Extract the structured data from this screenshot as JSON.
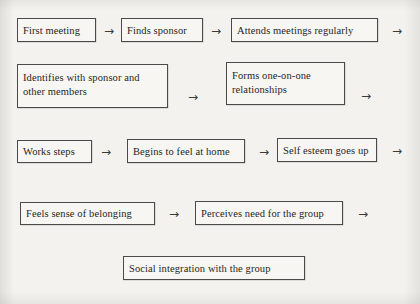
{
  "diagram": {
    "arrow_glyph": "→",
    "rows": [
      {
        "id": "row-1",
        "nodes": [
          {
            "id": "first-meeting",
            "label": "First meeting"
          },
          {
            "id": "finds-sponsor",
            "label": "Finds sponsor"
          },
          {
            "id": "attends-meetings-regularly",
            "label": "Attends meetings regularly"
          }
        ],
        "trailing_arrow": true
      },
      {
        "id": "row-2",
        "nodes": [
          {
            "id": "identifies-with-sponsor",
            "label": "Identifies with sponsor and other members"
          },
          {
            "id": "forms-one-on-one-relationships",
            "label": "Forms one-on-one relationships"
          }
        ],
        "trailing_arrow": true
      },
      {
        "id": "row-3",
        "nodes": [
          {
            "id": "works-steps",
            "label": "Works steps"
          },
          {
            "id": "begins-to-feel-at-home",
            "label": "Begins to feel at home"
          },
          {
            "id": "self-esteem-goes-up",
            "label": "Self esteem goes up"
          }
        ],
        "trailing_arrow": true
      },
      {
        "id": "row-4",
        "nodes": [
          {
            "id": "feels-sense-of-belonging",
            "label": "Feels sense of belonging"
          },
          {
            "id": "perceives-need-for-the-group",
            "label": "Perceives need for the group"
          }
        ],
        "trailing_arrow": true
      },
      {
        "id": "row-5",
        "nodes": [
          {
            "id": "social-integration-with-the-group",
            "label": "Social integration with the group"
          }
        ],
        "trailing_arrow": false
      }
    ]
  },
  "colors": {
    "page_background": "#f4f2ef",
    "node_border": "#4a4a4a",
    "node_fill": "#f7f6f3",
    "text": "#1f1f1f",
    "arrow": "#3a3a3a"
  }
}
